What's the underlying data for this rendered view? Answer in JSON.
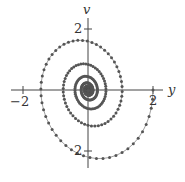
{
  "chart_data": {
    "type": "scatter",
    "title": "",
    "xlabel": "y",
    "ylabel": "v",
    "xlim": [
      -2.4,
      2.4
    ],
    "ylim": [
      -2.5,
      2.5
    ],
    "x_ticks": [
      {
        "value": -2,
        "label": "−2"
      },
      {
        "value": 2,
        "label": "2"
      }
    ],
    "y_ticks": [
      {
        "value": 2,
        "label": "2"
      },
      {
        "value": -2,
        "label": "−2"
      }
    ],
    "grid": false,
    "legend": null,
    "model": {
      "y0": 2,
      "v0": 0,
      "omega": 1.3,
      "damping": 0.133,
      "t_max": 40,
      "dt": 0.09
    },
    "key_points": [
      {
        "y": 2.0,
        "v": 0.0
      },
      {
        "y": 0.55,
        "v": -2.45
      },
      {
        "y": -1.45,
        "v": 0.0
      },
      {
        "y": -0.3,
        "v": 1.75
      },
      {
        "y": 0.85,
        "v": 0.0
      },
      {
        "y": 0.0,
        "v": 0.0
      }
    ],
    "color": "#555555"
  },
  "labels": {
    "x_axis": "y",
    "y_axis": "v",
    "xtick_neg": "−2",
    "xtick_pos": "2",
    "ytick_pos": "2",
    "ytick_neg": "2"
  }
}
